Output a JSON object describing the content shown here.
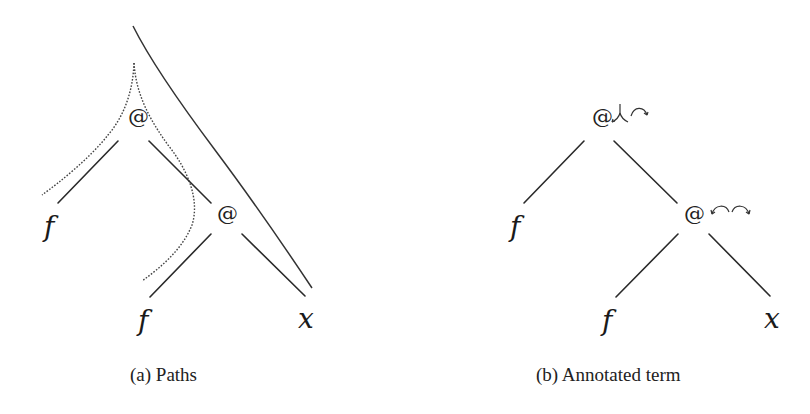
{
  "figure": {
    "subfigures": [
      {
        "id": "a",
        "caption": "(a) Paths",
        "nodes": {
          "root": "@",
          "inner": "@",
          "leaf_left": "f",
          "leaf_inner_left": "f",
          "leaf_inner_right": "x"
        },
        "paths": {
          "solid": "path through right spine to x",
          "dotted": [
            "path to left f",
            "path to inner f"
          ]
        }
      },
      {
        "id": "b",
        "caption": "(b) Annotated term",
        "nodes": {
          "root": "@",
          "inner": "@",
          "leaf_left": "f",
          "leaf_inner_left": "f",
          "leaf_inner_right": "x"
        },
        "annotations": {
          "root": [
            "fork-arrow",
            "curved-arrow"
          ],
          "inner": [
            "curved-arrow-left",
            "curved-arrow-right"
          ]
        }
      }
    ]
  }
}
